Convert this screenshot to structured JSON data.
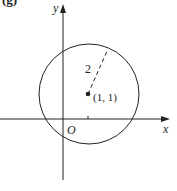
{
  "figure": {
    "panel_label": "(g)",
    "x_axis_label": "x",
    "y_axis_label": "y",
    "origin_label": "O",
    "center_label": "(1, 1)",
    "radius_label": "2",
    "circle": {
      "center": [
        1,
        1
      ],
      "radius": 2
    },
    "colors": {
      "stroke": "#222222",
      "background": "#ffffff"
    }
  }
}
